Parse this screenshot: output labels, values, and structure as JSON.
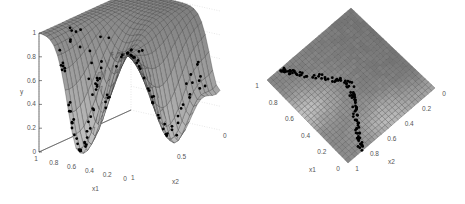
{
  "chart_data": [
    {
      "type": "surface3d",
      "view": "perspective",
      "title": "",
      "xlabel": "x1",
      "ylabel": "x2",
      "zlabel": "y",
      "xlim": [
        0,
        1
      ],
      "ylim": [
        0,
        1
      ],
      "zlim": [
        0,
        1
      ],
      "x_ticks": [
        "1",
        "0.8",
        "0.6",
        "0.4",
        "0.2",
        "0"
      ],
      "y_ticks": [
        "1",
        "0.5",
        "0"
      ],
      "z_ticks": [
        "0",
        "0.2",
        "0.4",
        "0.6",
        "0.8",
        "1"
      ],
      "grid": true,
      "surface_color": "#9a9a9a",
      "mesh_color": "#333333",
      "point_color": "#000000",
      "description": "Smooth surface near 1 over most of the domain, dropping toward 0 in a curved valley along the x1/x2 boundary; black scatter points lie along the valley rim",
      "points_count_approx": 120
    },
    {
      "type": "surface3d",
      "view": "top",
      "title": "",
      "xlabel": "x1",
      "ylabel": "x2",
      "xlim": [
        0,
        1
      ],
      "ylim": [
        0,
        1
      ],
      "x_ticks": [
        "1",
        "0.8",
        "0.6",
        "0.4",
        "0.2",
        "0"
      ],
      "y_ticks": [
        "0",
        "0.2",
        "0.4",
        "0.6",
        "0.8",
        "1"
      ],
      "grid": true,
      "surface_color": "#8a8a8a",
      "mesh_color": "#444444",
      "point_color": "#000000",
      "description": "Top-down view of the same surface; scatter points form a curved band near the lower edges",
      "points_count_approx": 120
    }
  ]
}
